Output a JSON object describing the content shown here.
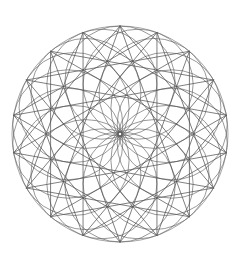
{
  "figure": {
    "title": "Geometric Rosette Pattern",
    "kind": "spirograph-rosette",
    "background_color": "#ffffff",
    "stroke_color": "#5a5a5a",
    "chord_color": "#4e4e4e",
    "canvas": {
      "width": 240,
      "height": 262
    }
  },
  "chart_data": {
    "type": "scatter",
    "title": "Geometric Rosette Pattern",
    "subtitle": "",
    "xlabel": "",
    "ylabel": "",
    "xlim": [
      0,
      240
    ],
    "ylim": [
      0,
      262
    ],
    "grid": false,
    "legend": "none",
    "annotations": [],
    "tick_labels": {
      "x": [],
      "y": []
    },
    "geometry": {
      "center_x": 120,
      "center_y": 134,
      "outer_radius": 108,
      "inner_hole_radius": 55,
      "ring_center_radius": 53,
      "circle_radius": 55,
      "point_count": 18,
      "star_step": 7,
      "rotation_deg": -90,
      "circle_stroke_width": 0.62,
      "chord_stroke_width": 0.72
    },
    "series": [
      {
        "name": "rosette-circles",
        "kind": "circle-ring",
        "count": 18,
        "radius": 55,
        "center_ring_radius": 53,
        "values": [
          0,
          20,
          40,
          60,
          80,
          100,
          120,
          140,
          160,
          180,
          200,
          220,
          240,
          260,
          280,
          300,
          320,
          340
        ]
      },
      {
        "name": "star-polygon-chords",
        "kind": "star-polygon",
        "schlafli": "{18/7}",
        "count": 18,
        "step": 7,
        "vertex_radius": 108,
        "values": [
          0,
          20,
          40,
          60,
          80,
          100,
          120,
          140,
          160,
          180,
          200,
          220,
          240,
          260,
          280,
          300,
          320,
          340
        ]
      },
      {
        "name": "outer-boundary-circle",
        "kind": "circle",
        "radius": 108,
        "values": [
          108
        ]
      }
    ]
  }
}
